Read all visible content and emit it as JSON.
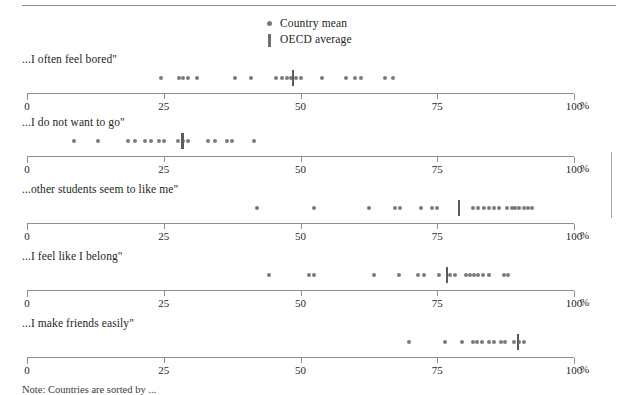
{
  "legend": {
    "items": [
      {
        "symbol": "dot",
        "icon": "country-mean-dot-icon",
        "label": "Country mean"
      },
      {
        "symbol": "bar",
        "icon": "oecd-average-bar-icon",
        "label": "OECD average"
      }
    ]
  },
  "axis": {
    "ticks": [
      0,
      25,
      50,
      75,
      100
    ],
    "tick_labels": [
      "0",
      "25",
      "50",
      "75",
      "100"
    ],
    "unit": "%",
    "min": 0,
    "max": 100
  },
  "note": "Note: Countries are sorted by ...",
  "colors": {
    "dot": "#7b7b7f",
    "oecd": "#5c5c60",
    "axis": "#8f8f8f",
    "rule": "#8c8c8c",
    "text": "#231f20"
  },
  "chart_data": {
    "type": "scatter",
    "title": "",
    "xlabel": "%",
    "ylabel": "",
    "xlim": [
      0,
      100
    ],
    "grid": false,
    "legend_position": "top-center",
    "panels": [
      {
        "label": "...I often feel bored\"",
        "oecd_average": 48.6,
        "values": [
          24.5,
          27.8,
          28.6,
          29.4,
          31.1,
          38.1,
          41.0,
          45.6,
          46.6,
          47.5,
          48.3,
          49.2,
          50.0,
          54.0,
          58.3,
          60.0,
          61.0,
          65.5,
          67.0
        ]
      },
      {
        "label": "...I do not want to go\"",
        "oecd_average": 28.4,
        "values": [
          8.6,
          13.0,
          18.5,
          19.8,
          21.5,
          22.6,
          24.2,
          25.1,
          27.6,
          28.6,
          29.4,
          33.0,
          34.3,
          36.5,
          37.5,
          41.5
        ]
      },
      {
        "label": "...other students seem to like me\"",
        "oecd_average": 79.0,
        "values": [
          42.0,
          52.4,
          62.5,
          67.2,
          68.2,
          72.0,
          74.1,
          75.0,
          81.5,
          82.5,
          83.5,
          85.3,
          86.2,
          87.7,
          88.6,
          90.0,
          90.9,
          91.5,
          92.3
        ],
        "extra_values": [
          84.4,
          89.2
        ]
      },
      {
        "label": "...I feel like I belong\"",
        "oecd_average": 76.8,
        "values": [
          44.3,
          51.6,
          52.5,
          63.5,
          68.0,
          71.5,
          72.5,
          75.3,
          77.3,
          78.2,
          80.2,
          81.0,
          81.8,
          82.5,
          83.3,
          84.5,
          87.2,
          88.0
        ]
      },
      {
        "label": "...I make friends easily\"",
        "oecd_average": 89.8,
        "values": [
          69.8,
          76.5,
          79.5,
          81.5,
          82.3,
          83.1,
          84.5,
          85.3,
          86.6,
          87.4,
          89.0,
          89.9,
          90.8
        ]
      }
    ]
  }
}
